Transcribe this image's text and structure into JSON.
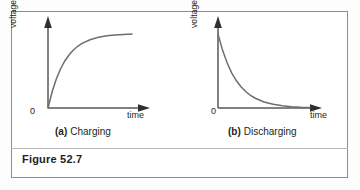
{
  "figure": {
    "caption": "Figure 52.7",
    "panels": [
      {
        "tag": "(a)",
        "title": "Charging",
        "ylabel": "voltage or charge",
        "xlabel": "time",
        "origin_label": "0"
      },
      {
        "tag": "(b)",
        "title": "Discharging",
        "ylabel": "voltage or charge",
        "xlabel": "time",
        "origin_label": "0"
      }
    ]
  },
  "colors": {
    "curve": "#6e6e70",
    "axis": "#58595b",
    "arrow": "#2f2f31",
    "frame": "#8d8d8d",
    "text": "#231f20",
    "background": "#ffffff"
  },
  "chart_data": [
    {
      "type": "line",
      "title": "(a) Charging",
      "xlabel": "time",
      "ylabel": "voltage or charge",
      "xlim": [
        0,
        5
      ],
      "ylim": [
        0,
        1
      ],
      "grid": false,
      "legend": null,
      "tick_labels": {
        "x": [
          "0"
        ],
        "y": [
          "0"
        ]
      },
      "annotations": [
        "0",
        "time",
        "voltage or charge"
      ],
      "series": [
        {
          "name": "charging exponential rise",
          "equation": "y = 1 - exp(-t/tau)",
          "x": [
            0.0,
            0.25,
            0.5,
            0.75,
            1.0,
            1.25,
            1.5,
            1.75,
            2.0,
            2.5,
            3.0,
            3.5,
            4.0,
            4.5,
            5.0
          ],
          "y": [
            0.0,
            0.221,
            0.393,
            0.528,
            0.632,
            0.713,
            0.777,
            0.826,
            0.865,
            0.918,
            0.95,
            0.97,
            0.982,
            0.989,
            0.993
          ]
        }
      ]
    },
    {
      "type": "line",
      "title": "(b) Discharging",
      "xlabel": "time",
      "ylabel": "voltage or charge",
      "xlim": [
        0,
        5
      ],
      "ylim": [
        0,
        1
      ],
      "grid": false,
      "legend": null,
      "tick_labels": {
        "x": [
          "0"
        ],
        "y": [
          "0"
        ]
      },
      "annotations": [
        "0",
        "time",
        "voltage or charge"
      ],
      "series": [
        {
          "name": "discharging exponential decay",
          "equation": "y = exp(-t/tau)",
          "x": [
            0.0,
            0.25,
            0.5,
            0.75,
            1.0,
            1.25,
            1.5,
            1.75,
            2.0,
            2.5,
            3.0,
            3.5,
            4.0,
            4.5,
            5.0
          ],
          "y": [
            1.0,
            0.779,
            0.607,
            0.472,
            0.368,
            0.287,
            0.223,
            0.174,
            0.135,
            0.082,
            0.05,
            0.03,
            0.018,
            0.011,
            0.007
          ]
        }
      ]
    }
  ]
}
